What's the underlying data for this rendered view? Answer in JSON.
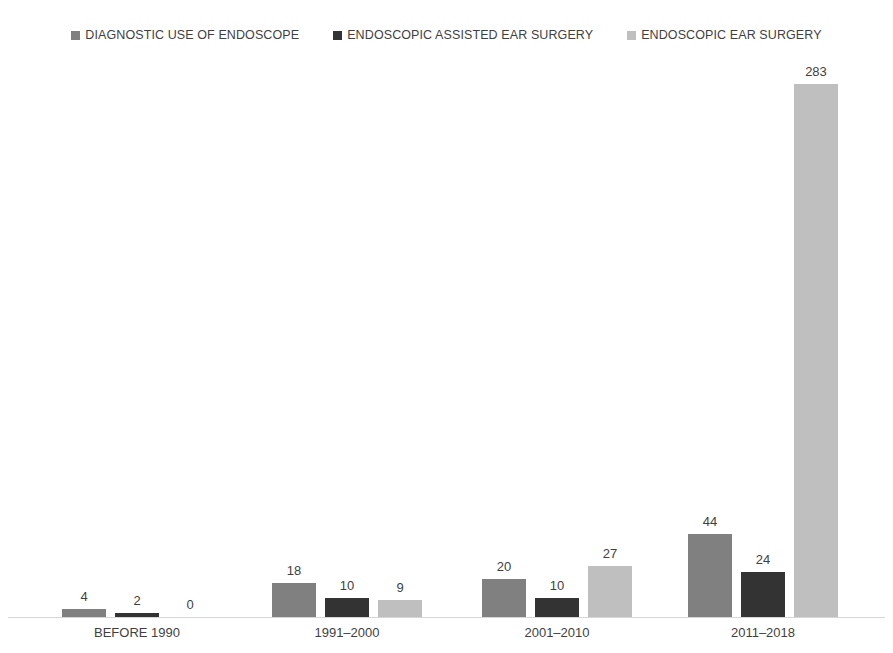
{
  "chart_data": {
    "type": "bar",
    "title": "",
    "xlabel": "",
    "ylabel": "",
    "grid": false,
    "legend_position": "top-center",
    "ylim": [
      0,
      300
    ],
    "categories": [
      "BEFORE 1990",
      "1991–2000",
      "2001–2010",
      "2011–2018"
    ],
    "series": [
      {
        "name": "DIAGNOSTIC USE OF ENDOSCOPE",
        "color": "#808080",
        "values": [
          4,
          18,
          20,
          44
        ],
        "labels": [
          "4",
          "18",
          "20",
          "44"
        ]
      },
      {
        "name": "ENDOSCOPIC ASSISTED EAR SURGERY",
        "color": "#333333",
        "values": [
          2,
          10,
          10,
          24
        ],
        "labels": [
          "2",
          "10",
          "10",
          "24"
        ]
      },
      {
        "name": "ENDOSCOPIC EAR SURGERY",
        "color": "#bfbfbf",
        "values": [
          0,
          9,
          27,
          283
        ],
        "labels": [
          "0",
          "9",
          "27",
          "283"
        ]
      }
    ]
  },
  "legend": {
    "items": [
      {
        "label": "DIAGNOSTIC USE OF ENDOSCOPE",
        "marker": "square-marker-icon"
      },
      {
        "label": "ENDOSCOPIC ASSISTED EAR SURGERY",
        "marker": "square-marker-icon"
      },
      {
        "label": "ENDOSCOPIC EAR SURGERY",
        "marker": "square-marker-icon"
      }
    ]
  }
}
